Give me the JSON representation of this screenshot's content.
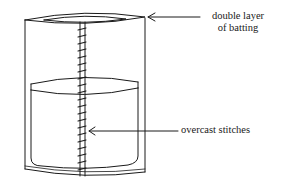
{
  "diagram": {
    "labels": {
      "batting_line1": "double layer",
      "batting_line2": "of batting",
      "stitches": "overcast stitches"
    },
    "colors": {
      "stroke": "#1a1a1a",
      "background": "#ffffff"
    }
  }
}
